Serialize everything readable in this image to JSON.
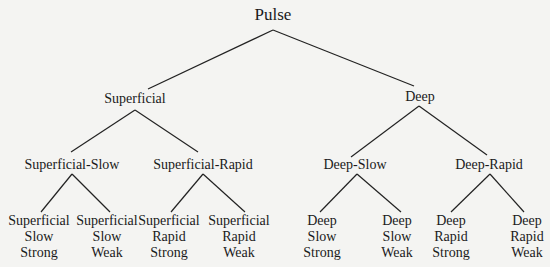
{
  "tree": {
    "root": {
      "label": "Pulse"
    },
    "level1": [
      {
        "label": "Superficial"
      },
      {
        "label": "Deep"
      }
    ],
    "level2": [
      {
        "label": "Superficial-Slow"
      },
      {
        "label": "Superficial-Rapid"
      },
      {
        "label": "Deep-Slow"
      },
      {
        "label": "Deep-Rapid"
      }
    ],
    "leaves": [
      {
        "lines": [
          "Superficial",
          "Slow",
          "Strong"
        ]
      },
      {
        "lines": [
          "Superficial",
          "Slow",
          "Weak"
        ]
      },
      {
        "lines": [
          "Superficial",
          "Rapid",
          "Strong"
        ]
      },
      {
        "lines": [
          "Superficial",
          "Rapid",
          "Weak"
        ]
      },
      {
        "lines": [
          "Deep",
          "Slow",
          "Strong"
        ]
      },
      {
        "lines": [
          "Deep",
          "Slow",
          "Weak"
        ]
      },
      {
        "lines": [
          "Deep",
          "Rapid",
          "Strong"
        ]
      },
      {
        "lines": [
          "Deep",
          "Rapid",
          "Weak"
        ]
      }
    ]
  }
}
